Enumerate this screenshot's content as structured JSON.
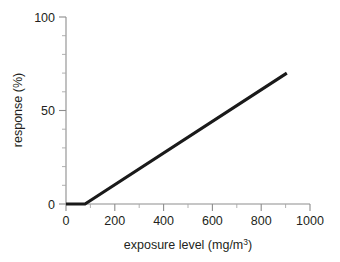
{
  "chart_data": {
    "type": "line",
    "title": "",
    "xlabel": "exposure level (mg/m3)",
    "xlabel_main": "exposure level (mg/m",
    "xlabel_sup": "3",
    "xlabel_close": ")",
    "ylabel": "response (%)",
    "xlim": [
      0,
      1000
    ],
    "ylim": [
      0,
      100
    ],
    "grid": false,
    "legend": null,
    "xticks": [
      0,
      200,
      400,
      600,
      800,
      1000
    ],
    "xtick_labels": [
      "0",
      "200",
      "400",
      "600",
      "800",
      "1000"
    ],
    "xticks_minor": [
      100,
      300,
      500,
      700,
      900
    ],
    "yticks": [
      0,
      50,
      100
    ],
    "ytick_labels": [
      "0",
      "50",
      "100"
    ],
    "yticks_minor": [
      10,
      20,
      30,
      40,
      60,
      70,
      80,
      90
    ],
    "series": [
      {
        "name": "threshold dose-response",
        "color": "#1a1a1a",
        "x": [
          0,
          78,
          905
        ],
        "y": [
          0,
          0,
          70
        ]
      }
    ],
    "annotations": [
      {
        "name": "threshold-point",
        "x": 78,
        "y": 0,
        "text": ""
      }
    ]
  },
  "axes": {
    "x_axis_name": "x-axis",
    "y_axis_name": "y-axis"
  }
}
